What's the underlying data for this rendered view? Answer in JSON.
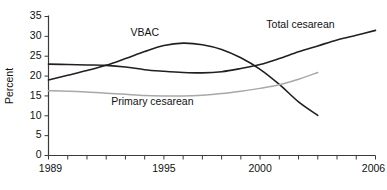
{
  "chart_data": {
    "type": "line",
    "title": "",
    "subtitle": "",
    "xlabel": "",
    "ylabel": "Percent",
    "xlim": [
      1989,
      2006
    ],
    "ylim": [
      0,
      35
    ],
    "grid": false,
    "legend_position": "inline-annotations",
    "y_ticks": [
      0,
      5,
      10,
      15,
      20,
      25,
      30,
      35
    ],
    "y_tick_labels": [
      "0",
      "5",
      "10",
      "15",
      "20",
      "25",
      "30",
      "35"
    ],
    "x_ticks": [
      1989,
      1990,
      1991,
      1992,
      1993,
      1994,
      1995,
      1996,
      1997,
      1998,
      1999,
      2000,
      2001,
      2002,
      2003,
      2004,
      2005,
      2006
    ],
    "x_tick_labels_shown": [
      "1989",
      "1995",
      "2000",
      "2006"
    ],
    "x_tick_label_years": [
      1989,
      1995,
      2000,
      2006
    ],
    "series": [
      {
        "name": "Total cesarean",
        "color": "#231f20",
        "x": [
          1989,
          1990,
          1991,
          1992,
          1993,
          1994,
          1995,
          1996,
          1997,
          1998,
          1999,
          2000,
          2001,
          2002,
          2003,
          2004,
          2005,
          2006
        ],
        "values": [
          23.0,
          22.9,
          22.8,
          22.7,
          22.3,
          21.6,
          21.2,
          20.9,
          20.8,
          21.1,
          21.9,
          22.9,
          24.4,
          26.1,
          27.6,
          29.1,
          30.3,
          31.5
        ]
      },
      {
        "name": "VBAC",
        "color": "#231f20",
        "x": [
          1989,
          1990,
          1991,
          1992,
          1993,
          1994,
          1995,
          1996,
          1997,
          1998,
          1999,
          2000,
          2001,
          2002,
          2003
        ],
        "values": [
          19.0,
          20.2,
          21.4,
          22.7,
          24.4,
          26.2,
          27.7,
          28.3,
          27.9,
          26.7,
          24.6,
          21.7,
          17.9,
          13.5,
          10.1
        ]
      },
      {
        "name": "Primary cesarean",
        "color": "#a8a8a8",
        "x": [
          1989,
          1990,
          1991,
          1992,
          1993,
          1994,
          1995,
          1996,
          1997,
          1998,
          1999,
          2000,
          2001,
          2002,
          2003
        ],
        "values": [
          16.3,
          16.2,
          16.0,
          15.7,
          15.4,
          15.1,
          15.0,
          15.0,
          15.2,
          15.6,
          16.2,
          16.9,
          17.8,
          19.2,
          20.9
        ]
      }
    ],
    "annotations": [
      {
        "text": "VBAC",
        "x": 1994.0,
        "y": 30.2,
        "anchor": "middle"
      },
      {
        "text": "Total cesarean",
        "x": 2002.1,
        "y": 32.0,
        "anchor": "middle"
      },
      {
        "text": "Primary cesarean",
        "x": 1994.4,
        "y": 12.6,
        "anchor": "middle"
      }
    ]
  },
  "axis": {
    "y_title": "Percent"
  }
}
